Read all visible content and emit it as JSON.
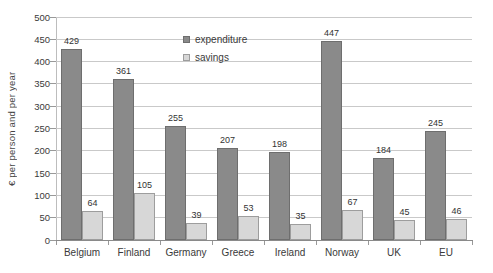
{
  "chart_data": {
    "type": "bar",
    "title": "",
    "ylabel": "€ per person and per year",
    "categories": [
      "Belgium",
      "Finland",
      "Germany",
      "Greece",
      "Ireland",
      "Norway",
      "UK",
      "EU"
    ],
    "series": [
      {
        "name": "expenditure",
        "color": "#8a8a8a",
        "border_color": "#6e6e6e",
        "values": [
          429,
          361,
          255,
          207,
          198,
          447,
          184,
          245
        ]
      },
      {
        "name": "savings",
        "color": "#d7d7d7",
        "border_color": "#9d9d9d",
        "values": [
          64,
          105,
          39,
          53,
          35,
          67,
          45,
          46
        ]
      }
    ],
    "ylim": [
      0,
      500
    ],
    "ytick_step": 50,
    "grid": true,
    "legend_position": "top-inside",
    "value_labels": true,
    "colors": {
      "gridline": "#c9c9c9",
      "axis": "#8a8a8a",
      "tick": "#999999",
      "text": "#3a3a3a",
      "background": "#ffffff"
    }
  }
}
